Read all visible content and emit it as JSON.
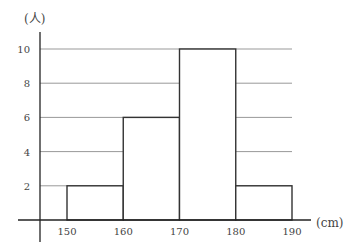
{
  "chart_data": {
    "type": "bar",
    "subtype": "histogram",
    "title": "",
    "xlabel": "(cm)",
    "ylabel": "(人)",
    "categories": [
      "150-160",
      "160-170",
      "170-180",
      "180-190"
    ],
    "bin_edges": [
      150,
      160,
      170,
      180,
      190
    ],
    "values": [
      2,
      6,
      10,
      2
    ],
    "x_ticks": [
      "150",
      "160",
      "170",
      "180",
      "190"
    ],
    "y_ticks": [
      "2",
      "4",
      "6",
      "8",
      "10"
    ],
    "ylim": [
      0,
      10
    ],
    "xlim": [
      150,
      190
    ],
    "grid": "horizontal",
    "legend": null,
    "colors": {
      "bar_fill": "#ffffff",
      "bar_stroke": "#333333",
      "grid": "#999999",
      "axis": "#222222"
    }
  },
  "labels": {
    "y_unit": "(人)",
    "x_unit": "(cm)"
  }
}
